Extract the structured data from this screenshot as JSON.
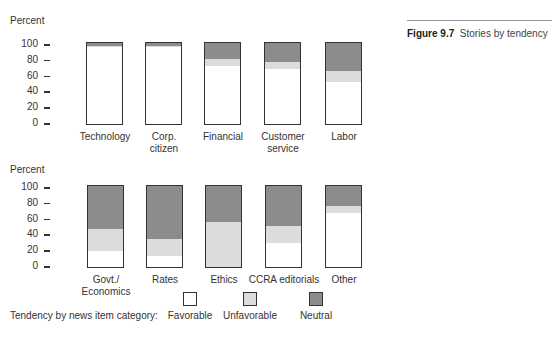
{
  "figure": {
    "number": "Figure 9.7",
    "title": "Stories by tendency"
  },
  "legend": {
    "title": "Tendency by news item category:",
    "items": [
      {
        "label": "Favorable",
        "color": "#ffffff"
      },
      {
        "label": "Unfavorable",
        "color": "#dcdcdc"
      },
      {
        "label": "Neutral",
        "color": "#8c8c8c"
      }
    ]
  },
  "colors": {
    "favorable": "#ffffff",
    "unfavorable": "#dcdcdc",
    "neutral": "#8c8c8c",
    "border": "#333333"
  },
  "chart_data": [
    {
      "type": "bar",
      "stacked": true,
      "title": "",
      "xlabel": "",
      "ylabel": "Percent",
      "ylim": [
        0,
        100
      ],
      "yticks": [
        0,
        20,
        40,
        60,
        80,
        100
      ],
      "grid": false,
      "categories": [
        "Technology",
        "Corp. citizen",
        "Financial",
        "Customer service",
        "Labor"
      ],
      "category_lines": [
        [
          "Technology"
        ],
        [
          "Corp.",
          "citizen"
        ],
        [
          "Financial"
        ],
        [
          "Customer",
          "service"
        ],
        [
          "Labor"
        ]
      ],
      "series": [
        {
          "name": "Favorable",
          "values": [
            95,
            95,
            72,
            68,
            52
          ]
        },
        {
          "name": "Unfavorable",
          "values": [
            1,
            1,
            8,
            9,
            14
          ]
        },
        {
          "name": "Neutral",
          "values": [
            4,
            4,
            20,
            23,
            34
          ]
        }
      ]
    },
    {
      "type": "bar",
      "stacked": true,
      "title": "",
      "xlabel": "",
      "ylabel": "Percent",
      "ylim": [
        0,
        100
      ],
      "yticks": [
        0,
        20,
        40,
        60,
        80,
        100
      ],
      "grid": false,
      "categories": [
        "Govt./Economics",
        "Rates",
        "Ethics",
        "CCRA editorials",
        "Other"
      ],
      "category_lines": [
        [
          "Govt./",
          "Economics"
        ],
        [
          "Rates"
        ],
        [
          "Ethics"
        ],
        [
          "CCRA editorials"
        ],
        [
          "Other"
        ]
      ],
      "series": [
        {
          "name": "Favorable",
          "values": [
            20,
            14,
            0,
            30,
            67
          ]
        },
        {
          "name": "Unfavorable",
          "values": [
            27,
            21,
            55,
            21,
            8
          ]
        },
        {
          "name": "Neutral",
          "values": [
            53,
            65,
            45,
            49,
            25
          ]
        }
      ]
    }
  ]
}
